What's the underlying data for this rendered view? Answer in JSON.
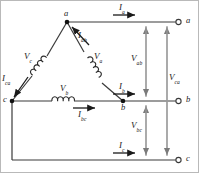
{
  "diagram": {
    "type": "circuit-schematic",
    "colors": {
      "wire": "#3a3a3a",
      "node": "#1a1a1a",
      "label": "#1a1a1a",
      "background": "#ffffff"
    },
    "nodes": [
      {
        "id": "a",
        "label": "a",
        "x": 67,
        "y": 22
      },
      {
        "id": "b",
        "label": "b",
        "x": 123,
        "y": 101
      },
      {
        "id": "c",
        "label": "c",
        "x": 12,
        "y": 101
      }
    ],
    "terminals": [
      {
        "id": "term-a",
        "label": "a",
        "x": 180,
        "y": 22
      },
      {
        "id": "term-b",
        "label": "b",
        "x": 180,
        "y": 101
      },
      {
        "id": "term-c",
        "label": "c",
        "x": 180,
        "y": 160
      }
    ],
    "phase_voltages": [
      {
        "id": "v-ca",
        "base": "V",
        "sub": "c",
        "x": 26,
        "y": 56
      },
      {
        "id": "v-ab",
        "base": "V",
        "sub": "a",
        "x": 96,
        "y": 56
      },
      {
        "id": "v-bc",
        "base": "V",
        "sub": "b",
        "x": 63,
        "y": 85
      }
    ],
    "phase_currents": [
      {
        "id": "i-ab",
        "base": "I",
        "sub": "ab",
        "x": 79,
        "y": 34
      },
      {
        "id": "i-ca",
        "base": "I",
        "sub": "ca",
        "x": 3,
        "y": 78
      },
      {
        "id": "i-bc",
        "base": "I",
        "sub": "bc",
        "x": 79,
        "y": 112
      }
    ],
    "line_currents": [
      {
        "id": "i-a",
        "base": "I",
        "sub": "a",
        "x": 119,
        "y": 6
      },
      {
        "id": "i-b",
        "base": "I",
        "sub": "b",
        "x": 119,
        "y": 86
      },
      {
        "id": "i-c",
        "base": "I",
        "sub": "c",
        "x": 119,
        "y": 145
      }
    ],
    "line_voltages": [
      {
        "id": "v-ab-line",
        "base": "V",
        "sub": "ab",
        "x": 133,
        "y": 57
      },
      {
        "id": "v-ca-line",
        "base": "V",
        "sub": "ca",
        "x": 170,
        "y": 76
      },
      {
        "id": "v-bc-line",
        "base": "V",
        "sub": "bc",
        "x": 133,
        "y": 124
      }
    ]
  }
}
